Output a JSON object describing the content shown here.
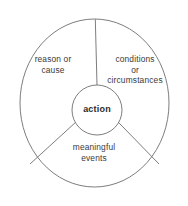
{
  "diagram": {
    "type": "segmented-circle",
    "background_color": "#ffffff",
    "stroke_color": "#6e6e6e",
    "text_color": "#3a3a3a",
    "center_text_color": "#2b2b2b",
    "outer_circle": {
      "name": "outer-circle",
      "center_x": 94.5,
      "center_y": 103,
      "radius_x": 74.5,
      "radius_y": 84
    },
    "inner_circle": {
      "name": "inner-circle",
      "center_x": 97,
      "center_y": 110,
      "radius": 25,
      "label": "action"
    },
    "segments": [
      {
        "name": "reason-or-cause",
        "label": "reason or\ncause",
        "position": "upper-left"
      },
      {
        "name": "conditions-or-circumstances",
        "label": "conditions\nor\ncircumstances",
        "position": "upper-right"
      },
      {
        "name": "meaningful-events",
        "label": "meaningful\nevents",
        "position": "bottom"
      }
    ],
    "dividers": [
      {
        "name": "divider-top",
        "angle_deg": -90
      },
      {
        "name": "divider-lower-left",
        "angle_deg": 150
      },
      {
        "name": "divider-lower-right",
        "angle_deg": 30
      }
    ]
  }
}
